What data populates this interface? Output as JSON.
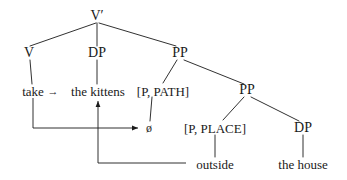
{
  "figure": {
    "kind": "syntax-tree",
    "ink_color": "#1a1a1a",
    "background_color": "#ffffff"
  },
  "nodes": {
    "root": "V′",
    "v": "V",
    "dp_obj": "DP",
    "pp_top": "PP",
    "pp_inner": "PP",
    "p_path": "[P, PATH]",
    "p_place": "[P, PLACE]",
    "dp_ground": "DP",
    "take": "take",
    "the_kittens": "the kittens",
    "null_head": "ø",
    "outside": "outside",
    "the_house": "the house"
  },
  "arrows": {
    "head_movement_label": "take-to-null-head-movement",
    "inline_arrow": "→",
    "kittens_raising_label": "kittens-raising-arrow",
    "outside_raising_label": "outside-raising-arrow"
  }
}
